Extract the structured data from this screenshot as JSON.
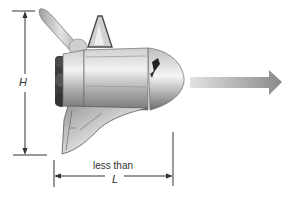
{
  "figure": {
    "height_label": "H",
    "length_label_prefix": "less than",
    "length_label": "L",
    "motion_arrow": "right-arrow",
    "colors": {
      "background": "#ffffff",
      "dimension_lines": "#333333",
      "shuttle_body_light": "#e6e6e6",
      "shuttle_body_mid": "#b5b5b5",
      "shuttle_body_dark": "#6f6f6f",
      "engine_dark": "#3c3c3c",
      "arrow_light": "#dcdcdc",
      "arrow_dark": "#8c8c8c"
    }
  }
}
